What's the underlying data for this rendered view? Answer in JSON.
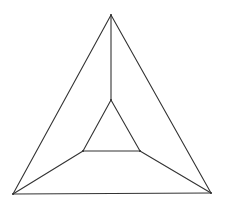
{
  "diagram": {
    "type": "planar-graph",
    "stroke_color": "#333333",
    "background": "#ffffff",
    "vertices": [
      {
        "id": "outer-top",
        "x": 111,
        "y": 15
      },
      {
        "id": "outer-left",
        "x": 13,
        "y": 194
      },
      {
        "id": "outer-right",
        "x": 211,
        "y": 193
      },
      {
        "id": "inner-top",
        "x": 111,
        "y": 100
      },
      {
        "id": "inner-left",
        "x": 83,
        "y": 151
      },
      {
        "id": "inner-right",
        "x": 140,
        "y": 151
      }
    ],
    "edges": [
      [
        "outer-top",
        "outer-left"
      ],
      [
        "outer-top",
        "outer-right"
      ],
      [
        "outer-left",
        "outer-right"
      ],
      [
        "inner-top",
        "inner-left"
      ],
      [
        "inner-top",
        "inner-right"
      ],
      [
        "inner-left",
        "inner-right"
      ],
      [
        "outer-top",
        "inner-top"
      ],
      [
        "outer-left",
        "inner-left"
      ],
      [
        "outer-right",
        "inner-right"
      ]
    ]
  }
}
